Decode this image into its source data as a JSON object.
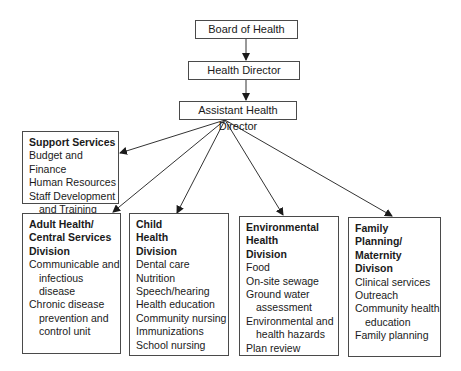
{
  "chart": {
    "top": [
      {
        "id": "board",
        "label": "Board of Health"
      },
      {
        "id": "director",
        "label": "Health Director"
      },
      {
        "id": "assistant",
        "label": "Assistant Health Director"
      }
    ],
    "support": {
      "title": "Support Services",
      "items": [
        {
          "lines": [
            "Budget and Finance"
          ]
        },
        {
          "lines": [
            "Human Resources"
          ]
        },
        {
          "lines": [
            "Staff Development",
            "and Training"
          ]
        }
      ]
    },
    "divisions": [
      {
        "id": "adult",
        "title_lines": [
          "Adult Health/",
          "Central Services",
          "Division"
        ],
        "items": [
          {
            "lines": [
              "Communicable and",
              "infectious disease"
            ]
          },
          {
            "lines": [
              "Chronic disease",
              "prevention and",
              "control unit"
            ]
          }
        ]
      },
      {
        "id": "child",
        "title_lines": [
          "Child",
          "Health",
          "Division"
        ],
        "items": [
          {
            "lines": [
              "Dental care"
            ]
          },
          {
            "lines": [
              "Nutrition"
            ]
          },
          {
            "lines": [
              "Speech/hearing"
            ]
          },
          {
            "lines": [
              "Health education"
            ]
          },
          {
            "lines": [
              "Community nursing"
            ]
          },
          {
            "lines": [
              "Immunizations"
            ]
          },
          {
            "lines": [
              "School nursing"
            ]
          }
        ]
      },
      {
        "id": "environmental",
        "title_lines": [
          "Environmental",
          "Health",
          "Division"
        ],
        "items": [
          {
            "lines": [
              "Food"
            ]
          },
          {
            "lines": [
              "On-site sewage"
            ]
          },
          {
            "lines": [
              "Ground water",
              "assessment"
            ]
          },
          {
            "lines": [
              "Environmental and",
              "health hazards"
            ]
          },
          {
            "lines": [
              "Plan review"
            ]
          }
        ]
      },
      {
        "id": "family",
        "title_lines": [
          "Family",
          "Planning/",
          "Maternity Divison"
        ],
        "items": [
          {
            "lines": [
              "Clinical services"
            ]
          },
          {
            "lines": [
              "Outreach"
            ]
          },
          {
            "lines": [
              "Community health",
              "education"
            ]
          },
          {
            "lines": [
              "Family planning"
            ]
          }
        ]
      }
    ]
  }
}
